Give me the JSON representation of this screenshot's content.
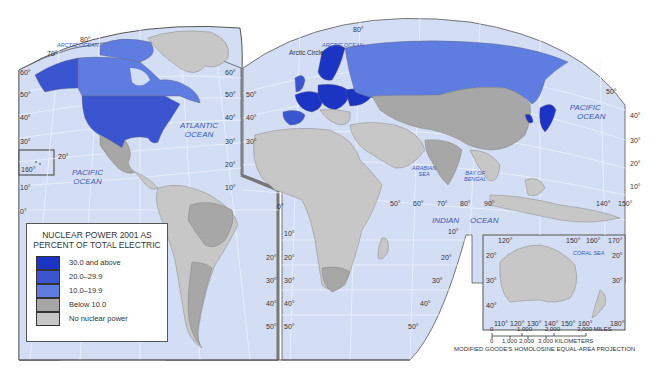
{
  "map": {
    "title": "Nuclear Power 2001 as Percent of Total Electric",
    "projection": "MODIFIED GOODE'S HOMOLOSINE EQUAL-AREA PROJECTION",
    "colors": {
      "water": "#d3ddf3",
      "frame": "#555555",
      "grid": "#eef2fb",
      "class_30_plus": "#1c34c4",
      "class_20_29": "#3a55cf",
      "class_10_19": "#5f7de0",
      "class_below_10": "#a7a7a7",
      "class_none": "#c7c7c7"
    },
    "legend": {
      "title_line1": "NUCLEAR POWER 2001 AS",
      "title_line2": "PERCENT OF TOTAL ELECTRIC",
      "items": [
        {
          "label": "30.0 and above",
          "color": "#1c34c4"
        },
        {
          "label": "20.0–29.9",
          "color": "#3a55cf"
        },
        {
          "label": "10.0–19.9",
          "color": "#5f7de0"
        },
        {
          "label": "Below 10.0",
          "color": "#a7a7a7"
        },
        {
          "label": "No nuclear power",
          "color": "#c7c7c7"
        }
      ]
    },
    "water_labels": {
      "arctic_ocean_west": "ARCTIC OCEAN",
      "arctic_ocean_east": "ARCTIC OCEAN",
      "atlantic_1": "ATLANTIC",
      "atlantic_2": "OCEAN",
      "pacific_west_1": "PACIFIC",
      "pacific_west_2": "OCEAN",
      "pacific_east_1": "PACIFIC",
      "pacific_east_2": "OCEAN",
      "arabian_1": "ARABIAN",
      "arabian_2": "SEA",
      "bengal_1": "BAY OF",
      "bengal_2": "BENGAL",
      "indian": "INDIAN",
      "indian_2": "OCEAN",
      "coral_sea": "CORAL SEA"
    },
    "feature_labels": {
      "arctic_circle": "Arctic Circle"
    },
    "graticule_labels": {
      "lat_west_left": [
        "60°",
        "50°",
        "40°",
        "30°",
        "10°",
        "0°"
      ],
      "lat_west_right": [
        "60°",
        "50°",
        "40°",
        "30°",
        "20°",
        "10°"
      ],
      "lat_east_left": [
        "50°",
        "40°",
        "30°"
      ],
      "lat_east_right": [
        "50°",
        "40°",
        "30°",
        "20°",
        "10°"
      ],
      "hawaii_lat": "20°",
      "hawaii_lon": "160°",
      "north_pole_west": "80°",
      "north_west_70": "70°",
      "north_pole_east": "80°",
      "equator_africa": "0°",
      "south_america_left": [
        "20°",
        "30°",
        "40°",
        "50°"
      ],
      "south_africa_left": [
        "10°",
        "20°",
        "30°",
        "40°",
        "50°"
      ],
      "lon_indian": [
        "50°",
        "60°",
        "70°",
        "80°",
        "90°"
      ],
      "lon_east_top": [
        "140°",
        "150°"
      ],
      "indian_lat": [
        "10°",
        "20°",
        "30°",
        "40°",
        "50°"
      ],
      "aus_top": [
        "120°",
        "150°",
        "160°",
        "170°"
      ],
      "aus_bottom": [
        "110°",
        "120°",
        "130°",
        "140°",
        "150°",
        "160°",
        "180°"
      ],
      "aus_left": [
        "20°",
        "30°",
        "40°"
      ],
      "aus_right": [
        "20°",
        "30°"
      ]
    },
    "scale_bar": {
      "miles": [
        "0",
        "1,000",
        "2,000",
        "3,000 MILES"
      ],
      "kilometers": [
        "0",
        "1,000",
        "2,000",
        "3,000 KILOMETERS"
      ]
    },
    "regions": [
      {
        "name": "United States",
        "class": "20.0–29.9"
      },
      {
        "name": "Canada",
        "class": "10.0–19.9"
      },
      {
        "name": "Mexico",
        "class": "Below 10.0"
      },
      {
        "name": "France",
        "class": "30.0 and above"
      },
      {
        "name": "Sweden",
        "class": "30.0 and above"
      },
      {
        "name": "Russia",
        "class": "10.0–19.9"
      },
      {
        "name": "Japan",
        "class": "30.0 and above"
      },
      {
        "name": "South Korea",
        "class": "30.0 and above"
      },
      {
        "name": "Spain",
        "class": "20.0–29.9"
      },
      {
        "name": "United Kingdom",
        "class": "20.0–29.9"
      },
      {
        "name": "China",
        "class": "Below 10.0"
      },
      {
        "name": "India",
        "class": "Below 10.0"
      },
      {
        "name": "Brazil",
        "class": "Below 10.0"
      },
      {
        "name": "Argentina",
        "class": "Below 10.0"
      },
      {
        "name": "South Africa",
        "class": "Below 10.0"
      },
      {
        "name": "Australia",
        "class": "No nuclear power"
      }
    ]
  }
}
